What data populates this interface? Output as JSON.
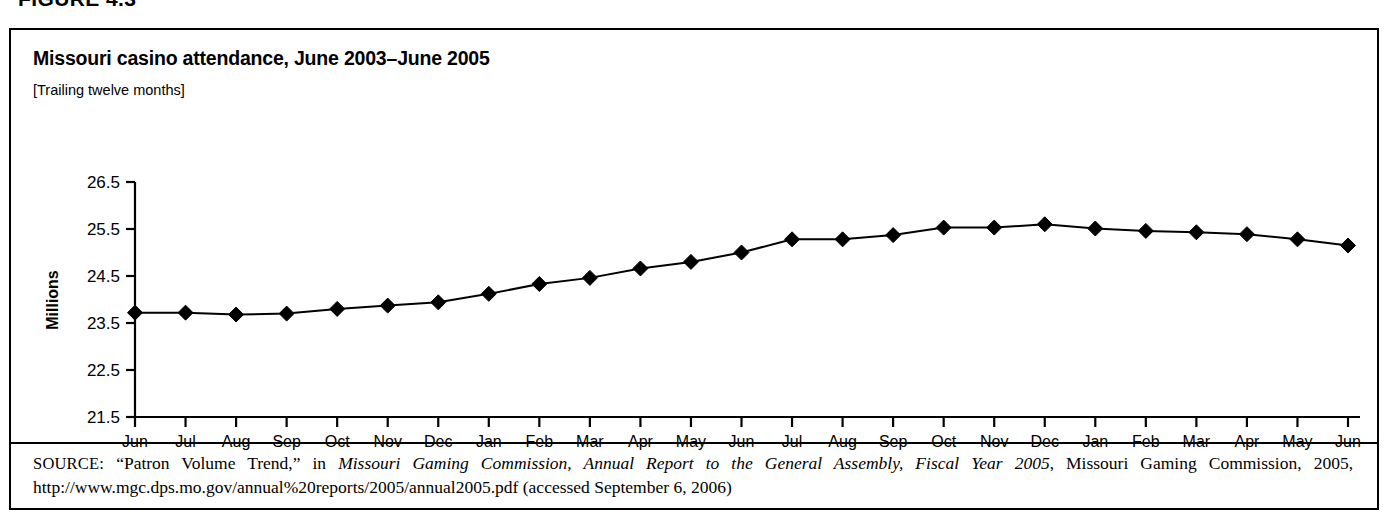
{
  "figure": {
    "label": "FIGURE 4.3"
  },
  "chart": {
    "title": "Missouri casino attendance, June 2003–June 2005",
    "subtitle": "[Trailing twelve months]"
  },
  "source": {
    "label": "SOURCE:",
    "part1": " “Patron Volume Trend,” in ",
    "italic": "Missouri Gaming Commission, Annual Report to the General Assembly, Fiscal Year 2005",
    "part2": ", Missouri Gaming Commission, 2005, http://www.mgc.dps.mo.gov/annual%20reports/2005/annual2005.pdf (accessed September 6, 2006)"
  },
  "chart_data": {
    "type": "line",
    "title": "Missouri casino attendance, June 2003–June 2005",
    "subtitle": "[Trailing twelve months]",
    "xlabel": "",
    "ylabel": "Millions",
    "ylim": [
      21.5,
      26.5
    ],
    "yticks": [
      21.5,
      22.5,
      23.5,
      24.5,
      25.5,
      26.5
    ],
    "ytick_labels": [
      "21.5",
      "22.5",
      "23.5",
      "24.5",
      "25.5",
      "26.5"
    ],
    "grid": false,
    "legend": "none",
    "marker": "diamond",
    "line_color": "#000000",
    "marker_color": "#000000",
    "categories": [
      "Jun-03",
      "Jul-03",
      "Aug-03",
      "Sep-03",
      "Oct-03",
      "Nov-03",
      "Dec-03",
      "Jan-04",
      "Feb-04",
      "Mar-04",
      "Apr-04",
      "May-04",
      "Jun-04",
      "Jul-04",
      "Aug-04",
      "Sep-04",
      "Oct-04",
      "Nov-04",
      "Dec-04",
      "Jan-05",
      "Feb-05",
      "Mar-05",
      "Apr-05",
      "May-05",
      "Jun-05"
    ],
    "xtick_labels_line1": [
      "Jun",
      "Jul",
      "Aug",
      "Sep",
      "Oct",
      "Nov",
      "Dec",
      "Jan",
      "Feb",
      "Mar",
      "Apr",
      "May",
      "Jun",
      "Jul",
      "Aug",
      "Sep",
      "Oct",
      "Nov",
      "Dec",
      "Jan",
      "Feb",
      "Mar",
      "Apr",
      "May",
      "Jun"
    ],
    "xtick_labels_line2": [
      "-03",
      "-03",
      "-03",
      "-03",
      "-03",
      "-03",
      "-03",
      "-04",
      "-04",
      "-04",
      "-04",
      "-04",
      "-04",
      "-04",
      "-04",
      "-04",
      "-04",
      "-04",
      "-04",
      "-05",
      "-05",
      "-05",
      "-05",
      "-05",
      "-05"
    ],
    "values": [
      23.72,
      23.72,
      23.68,
      23.7,
      23.8,
      23.87,
      23.94,
      24.12,
      24.33,
      24.46,
      24.66,
      24.8,
      25.0,
      25.28,
      25.28,
      25.37,
      25.53,
      25.53,
      25.6,
      25.51,
      25.46,
      25.43,
      25.39,
      25.28,
      25.15
    ]
  }
}
